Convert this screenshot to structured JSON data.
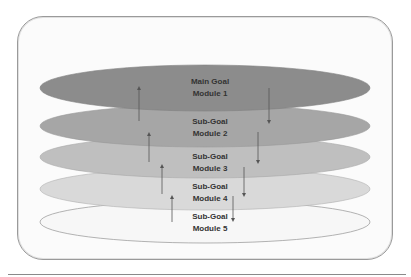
{
  "diagram": {
    "layers": [
      {
        "line1": "Main Goal",
        "line2": "Module 1",
        "fill": "#8c8c8c"
      },
      {
        "line1": "Sub-Goal",
        "line2": "Module 2",
        "fill": "#a6a6a6"
      },
      {
        "line1": "Sub-Goal",
        "line2": "Module 3",
        "fill": "#bfbfbf"
      },
      {
        "line1": "Sub-Goal",
        "line2": "Module 4",
        "fill": "#d9d9d9"
      },
      {
        "line1": "Sub-Goal",
        "line2": "Module 5",
        "fill": "#f7f7f7"
      }
    ],
    "arrow_color": "#555555",
    "frame_border": "#9a9a9a"
  }
}
